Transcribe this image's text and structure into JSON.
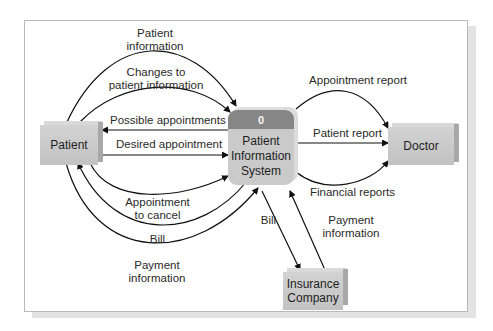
{
  "diagram": {
    "type": "data-flow-diagram (context)",
    "process": {
      "number": "0",
      "name_line1": "Patient",
      "name_line2": "Information",
      "name_line3": "System"
    },
    "entities": {
      "patient": "Patient",
      "doctor": "Doctor",
      "insurance_line1": "Insurance",
      "insurance_line2": "Company"
    },
    "flows": {
      "patient_information": {
        "line1": "Patient",
        "line2": "information",
        "from": "Patient",
        "to": "Patient Information System"
      },
      "changes": {
        "line1": "Changes to",
        "line2": "patient information",
        "from": "Patient",
        "to": "Patient Information System"
      },
      "possible_appointments": {
        "label": "Possible appointments",
        "from": "Patient Information System",
        "to": "Patient"
      },
      "desired_appointment": {
        "label": "Desired appointment",
        "from": "Patient",
        "to": "Patient Information System"
      },
      "appointment_to_cancel": {
        "line1": "Appointment",
        "line2": "to cancel",
        "from": "Patient",
        "to": "Patient Information System"
      },
      "bill_patient": {
        "label": "Bill",
        "from": "Patient Information System",
        "to": "Patient"
      },
      "payment_patient": {
        "line1": "Payment",
        "line2": "information",
        "from": "Patient",
        "to": "Patient Information System"
      },
      "appointment_report": {
        "label": "Appointment report",
        "from": "Patient Information System",
        "to": "Doctor"
      },
      "patient_report": {
        "label": "Patient report",
        "from": "Patient Information System",
        "to": "Doctor"
      },
      "financial_reports": {
        "label": "Financial reports",
        "from": "Patient Information System",
        "to": "Doctor"
      },
      "bill_insurance": {
        "label": "Bill",
        "from": "Patient Information System",
        "to": "Insurance Company"
      },
      "payment_insurance": {
        "line1": "Payment",
        "line2": "information",
        "from": "Insurance Company",
        "to": "Patient Information System"
      }
    }
  }
}
